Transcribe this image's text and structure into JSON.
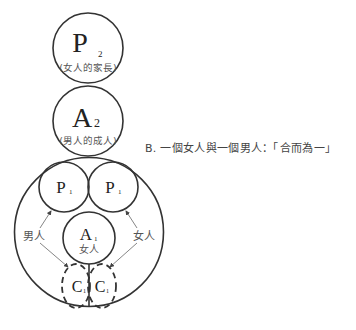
{
  "diagram": {
    "caption": "B. 一個女人與一個男人：「合而為一」",
    "nodes": {
      "p2": {
        "letter": "P",
        "sub": "2",
        "label": "(女人的家長)"
      },
      "a2": {
        "letter": "A",
        "sub": "2",
        "label": "(男人的成人)"
      },
      "p1_left": {
        "letter": "P",
        "sub": "1"
      },
      "p1_right": {
        "letter": "P",
        "sub": "1"
      },
      "a1": {
        "letter": "A",
        "sub": "1",
        "label": "女人"
      },
      "c_left": {
        "letter": "C",
        "sub": "1"
      },
      "c_right": {
        "letter": "C",
        "sub": "1"
      }
    },
    "arrow_labels": {
      "left": "男人",
      "right": "女人"
    },
    "colors": {
      "stroke": "#333333",
      "arrow": "#666666",
      "background": "#ffffff"
    }
  }
}
